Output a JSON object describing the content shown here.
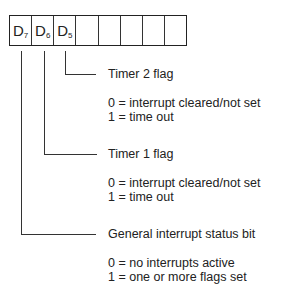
{
  "register": {
    "cells": [
      {
        "main": "D",
        "sub": "7"
      },
      {
        "main": "D",
        "sub": "6"
      },
      {
        "main": "D",
        "sub": "5"
      },
      {
        "main": "",
        "sub": ""
      },
      {
        "main": "",
        "sub": ""
      },
      {
        "main": "",
        "sub": ""
      },
      {
        "main": "",
        "sub": ""
      },
      {
        "main": "",
        "sub": ""
      }
    ]
  },
  "bits": [
    {
      "bit": "D5",
      "title": "Timer 2 flag",
      "values": [
        "0 = interrupt cleared/not set",
        "1 = time out"
      ]
    },
    {
      "bit": "D6",
      "title": "Timer 1 flag",
      "values": [
        "0 = interrupt cleared/not set",
        "1 = time out"
      ]
    },
    {
      "bit": "D7",
      "title": "General interrupt status bit",
      "values": [
        "0 = no interrupts active",
        "1 = one or more flags set"
      ]
    }
  ]
}
